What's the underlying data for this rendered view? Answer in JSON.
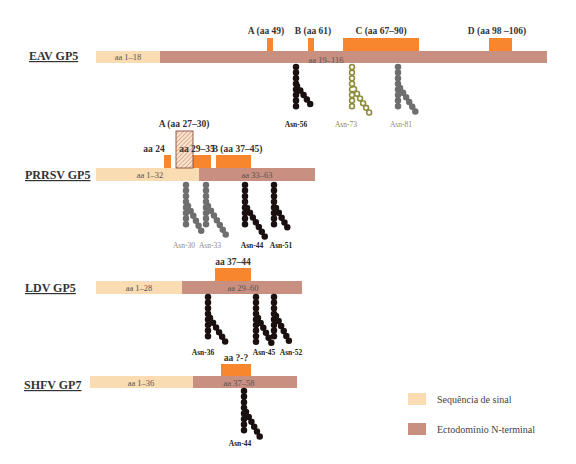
{
  "colors": {
    "signal_sequence": "#f9dcb1",
    "ectodomain": "#c98f80",
    "epitope": "#f7862f",
    "glycan_black": "#1a1010",
    "glycan_grey": "#6e6e6e",
    "glycan_olive": "#8c8c3c"
  },
  "proteins": {
    "eav": {
      "name": "EAV GP5",
      "signal_label": "aa 1–18",
      "ecto_label": "aa 19–116",
      "blocks": [
        "A (aa 49)",
        "B (aa 61)",
        "C (aa 67–90)",
        "D (aa 98 –106)"
      ],
      "glycans": [
        "Asn-56",
        "Asn-73",
        "Asn-81"
      ]
    },
    "prrsv": {
      "name": "PRRSV GP5",
      "signal_label": "aa 1–32",
      "ecto_label": "aa 33–63",
      "blocks": [
        "A (aa 27–30)",
        "aa 24",
        "aa 29–35",
        "B (aa 37–45)"
      ],
      "glycans": [
        "Asn-30",
        "Asn-33",
        "Asn-44",
        "Asn-51"
      ]
    },
    "ldv": {
      "name": "LDV GP5",
      "signal_label": "aa 1–28",
      "ecto_label": "aa 29–60",
      "blocks": [
        "aa 37–44"
      ],
      "glycans": [
        "Asn-36",
        "Asn-45",
        "Asn-52"
      ]
    },
    "shfv": {
      "name": "SHFV GP7",
      "signal_label": "aa 1–36",
      "ecto_label": "aa 37–58",
      "blocks": [
        "aa ?-?"
      ],
      "glycans": [
        "Asn-44"
      ]
    }
  },
  "legend": {
    "items": [
      {
        "label": "Sequência de sinal",
        "color": "#f9dcb1"
      },
      {
        "label": "Ectodomínio N-terminal",
        "color": "#c98f80"
      }
    ]
  }
}
